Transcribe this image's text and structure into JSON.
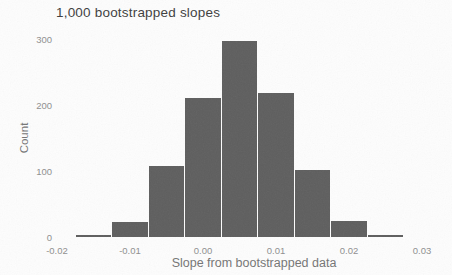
{
  "chart_data": {
    "type": "bar",
    "subtype": "histogram",
    "title": "1,000 bootstrapped slopes",
    "xlabel": "Slope from bootstrapped data",
    "ylabel": "Count",
    "bin_width": 0.005,
    "bin_centers": [
      -0.015,
      -0.01,
      -0.005,
      0.0,
      0.005,
      0.01,
      0.015,
      0.02,
      0.025
    ],
    "values": [
      3,
      22,
      108,
      211,
      297,
      218,
      101,
      25,
      3
    ],
    "xlim": [
      -0.02,
      0.03
    ],
    "ylim": [
      0,
      300
    ],
    "xticks": [
      -0.02,
      -0.01,
      0.0,
      0.01,
      0.02,
      0.03
    ],
    "xtick_labels": [
      "-0.02",
      "-0.01",
      "0.00",
      "0.01",
      "0.02",
      "0.03"
    ],
    "yticks": [
      0,
      100,
      200,
      300
    ],
    "ytick_labels": [
      "0",
      "100",
      "200",
      "300"
    ],
    "grid": false,
    "legend": false,
    "bar_color": "#5e5e5e",
    "bar_gap_color": "#ffffff",
    "background": "#fdfdfd",
    "text_colors": {
      "title": "#3d3d3d",
      "ticks": "#8f8f8f",
      "axis_labels": "#757575"
    }
  }
}
